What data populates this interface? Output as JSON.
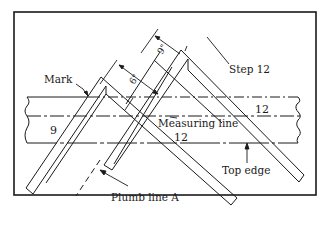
{
  "diagram": {
    "labels": {
      "mark": "Mark",
      "step": "Step 12",
      "measuring_line": "Measuring line",
      "top_edge": "Top edge",
      "plumb_line": "Plumb line A",
      "run_left": "9",
      "run_upper_right": "12",
      "run_lower_middle": "12",
      "dim_6": "6\"",
      "dim_9": "9\""
    },
    "colors": {
      "line": "#1a1a1a",
      "background": "#ffffff"
    }
  }
}
